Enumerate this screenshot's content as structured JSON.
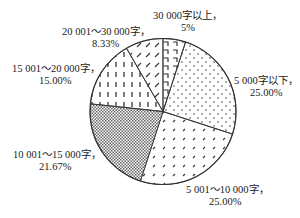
{
  "chart_data": {
    "type": "pie",
    "title": "",
    "start_angle_deg": 0,
    "direction": "clockwise",
    "slices": [
      {
        "name": "30 000字以上",
        "label": "30 000字以上，",
        "pct_label": "5%",
        "value": 5.0,
        "pattern": "hook"
      },
      {
        "name": "5 000字以下",
        "label": "5 000字以下，",
        "pct_label": "25.00%",
        "value": 25.0,
        "pattern": "dots"
      },
      {
        "name": "5 001～10 000字",
        "label": "5 001～10 000字，",
        "pct_label": "25.00%",
        "value": 25.0,
        "pattern": "tiny-dashes"
      },
      {
        "name": "10 001～15 000字",
        "label": "10 001～15 000字，",
        "pct_label": "21.67%",
        "value": 21.67,
        "pattern": "checker"
      },
      {
        "name": "15 001～20 000字",
        "label": "15 001～20 000字，",
        "pct_label": "15.00%",
        "value": 15.0,
        "pattern": "vertical-dashes"
      },
      {
        "name": "20 001～30 000字",
        "label": "20 001～30 000字，",
        "pct_label": "8.33%",
        "value": 8.33,
        "pattern": "slashes"
      }
    ],
    "colors": {
      "stroke": "#333333",
      "pattern": "#333333",
      "background": "#ffffff"
    }
  },
  "labels": [
    {
      "line1": "30 000字以上，",
      "line2": "5%",
      "x": 153,
      "y": 10,
      "x2": 181
    },
    {
      "line1": "5 000字以下，",
      "line2": "25.00%",
      "x": 234,
      "y": 75,
      "x2": 250
    },
    {
      "line1": "5 001～10 000字，",
      "line2": "25.00%",
      "x": 186,
      "y": 184,
      "x2": 209
    },
    {
      "line1": "10 001～15 000字，",
      "line2": "21.67%",
      "x": 13,
      "y": 149,
      "x2": 39
    },
    {
      "line1": "15 001～20 000字，",
      "line2": "15.00%",
      "x": 12,
      "y": 63,
      "x2": 39
    },
    {
      "line1": "20 001～30 000字，",
      "line2": "8.33%",
      "x": 62,
      "y": 26,
      "x2": 92
    }
  ]
}
